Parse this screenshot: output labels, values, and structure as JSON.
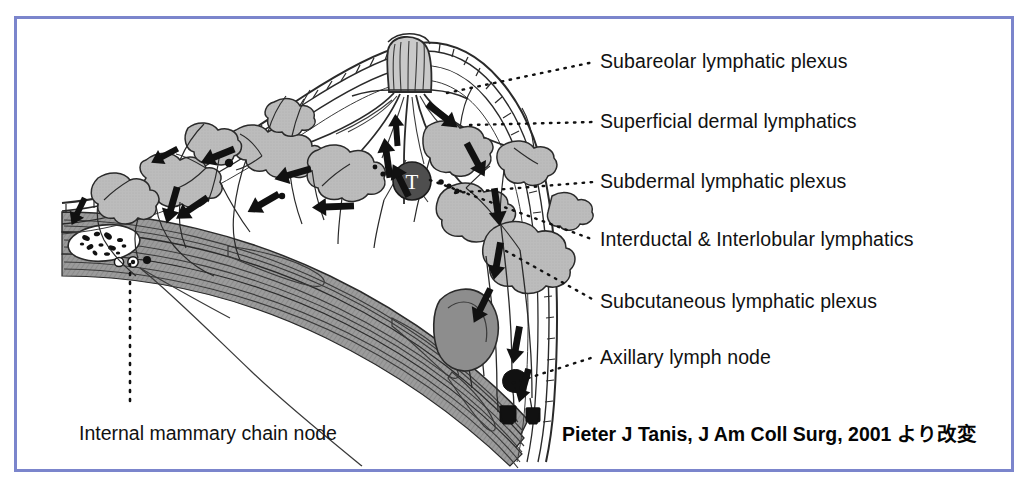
{
  "figure": {
    "title_absent": true,
    "border_color": "#7b85cc",
    "background": "#ffffff",
    "ink_color": "#1a1a1a",
    "lobule_fill": "#b9b9b9",
    "muscle_fill": "#9a9a9a",
    "tumor_fill": "#4a4a4a",
    "tumor_marker": "T"
  },
  "labels": {
    "right": [
      {
        "text": "Subareolar lymphatic plexus",
        "x": 600,
        "y": 52,
        "leader_from_x": 447,
        "leader_from_y": 93,
        "leader_to_x": 594,
        "leader_to_y": 62
      },
      {
        "text": "Superficial dermal lymphatics",
        "x": 600,
        "y": 112,
        "leader_from_x": 470,
        "leader_from_y": 125,
        "leader_to_x": 594,
        "leader_to_y": 122
      },
      {
        "text": "Subdermal lymphatic plexus",
        "x": 600,
        "y": 172,
        "leader_from_x": 455,
        "leader_from_y": 193,
        "leader_to_x": 594,
        "leader_to_y": 182
      },
      {
        "text": "Interductal & Interlobular lymphatics",
        "x": 600,
        "y": 230,
        "leader_from_x": 430,
        "leader_from_y": 180,
        "leader_to_x": 594,
        "leader_to_y": 240
      },
      {
        "text": "Subcutaneous lymphatic plexus",
        "x": 600,
        "y": 292,
        "leader_from_x": 506,
        "leader_from_y": 251,
        "leader_to_x": 594,
        "leader_to_y": 300
      },
      {
        "text": "Axillary lymph node",
        "x": 600,
        "y": 348,
        "leader_from_x": 513,
        "leader_from_y": 383,
        "leader_to_x": 594,
        "leader_to_y": 357
      }
    ],
    "bottom_left": {
      "text": "Internal mammary chain node",
      "x": 79,
      "y": 424
    },
    "internal_mammary_leader": {
      "from_x": 130,
      "from_y": 262,
      "to_x": 130,
      "to_y": 410
    }
  },
  "citation": {
    "text": "Pieter J Tanis, J Am Coll Surg, 2001 より改変",
    "x": 562,
    "y": 425
  },
  "anatomy": {
    "structures": [
      "skin-dermis-band",
      "subdermal-plexus-ladder",
      "nipple-areola",
      "lactiferous-ducts",
      "breast-lobules",
      "pectoralis-muscle",
      "rib-cross-section",
      "internal-mammary-vessels",
      "tumor",
      "axillary-lymph-nodes",
      "lymph-flow-arrows"
    ]
  }
}
